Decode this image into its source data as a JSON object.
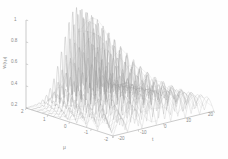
{
  "figure": {
    "kind": "matlab-3d-mesh-plot",
    "background": "#fefefe",
    "mesh_color": "#9a9a9a",
    "axis_color": "#a8a8a8",
    "tick_text_color": "#8a8a8a"
  },
  "axes": {
    "z": {
      "title": "W(t,μ)",
      "ticks": [
        "1",
        "0.8",
        "0.6",
        "0.4",
        "0.2"
      ],
      "values": [
        1,
        0.8,
        0.6,
        0.4,
        0.2
      ],
      "range": [
        0.2,
        1
      ]
    },
    "mu": {
      "title": "μ",
      "ticks": [
        "2",
        "1",
        "0",
        "-1",
        "-2"
      ],
      "values": [
        2,
        1,
        0,
        -1,
        -2
      ],
      "range": [
        -2,
        2
      ]
    },
    "t": {
      "title": "t",
      "ticks": [
        "-20",
        "-10",
        "0",
        "10",
        "20"
      ],
      "values": [
        -20,
        -10,
        0,
        10,
        20
      ],
      "range": [
        -20,
        20
      ]
    }
  },
  "chart_data": {
    "type": "line",
    "title": "",
    "xlabel": "t",
    "ylabel": "μ",
    "zlabel": "W(t,μ)",
    "xlim": [
      -20,
      20
    ],
    "ylim": [
      -2,
      2
    ],
    "zlim": [
      0.2,
      1
    ],
    "grid": false,
    "legend": null,
    "series": [
      {
        "name": "mu = -2.00",
        "mu": -2.0,
        "amplitude": 0.3,
        "frequency": 0.55,
        "envelope_width": 17.0
      },
      {
        "name": "mu = -1.75",
        "mu": -1.75,
        "amplitude": 0.32,
        "frequency": 0.6,
        "envelope_width": 16.0
      },
      {
        "name": "mu = -1.50",
        "mu": -1.5,
        "amplitude": 0.34,
        "frequency": 0.66,
        "envelope_width": 15.0
      },
      {
        "name": "mu = -1.25",
        "mu": -1.25,
        "amplitude": 0.37,
        "frequency": 0.72,
        "envelope_width": 14.0
      },
      {
        "name": "mu = -1.00",
        "mu": -1.0,
        "amplitude": 0.41,
        "frequency": 0.8,
        "envelope_width": 13.0
      },
      {
        "name": "mu = -0.75",
        "mu": -0.75,
        "amplitude": 0.45,
        "frequency": 0.88,
        "envelope_width": 12.0
      },
      {
        "name": "mu = -0.50",
        "mu": -0.5,
        "amplitude": 0.5,
        "frequency": 0.97,
        "envelope_width": 11.0
      },
      {
        "name": "mu = -0.25",
        "mu": -0.25,
        "amplitude": 0.56,
        "frequency": 1.06,
        "envelope_width": 10.0
      },
      {
        "name": "mu = 0.00",
        "mu": 0.0,
        "amplitude": 0.63,
        "frequency": 1.16,
        "envelope_width": 9.2
      },
      {
        "name": "mu = 0.25",
        "mu": 0.25,
        "amplitude": 0.7,
        "frequency": 1.27,
        "envelope_width": 8.4
      },
      {
        "name": "mu = 0.50",
        "mu": 0.5,
        "amplitude": 0.77,
        "frequency": 1.38,
        "envelope_width": 7.7
      },
      {
        "name": "mu = 0.75",
        "mu": 0.75,
        "amplitude": 0.84,
        "frequency": 1.5,
        "envelope_width": 7.1
      },
      {
        "name": "mu = 1.00",
        "mu": 1.0,
        "amplitude": 0.9,
        "frequency": 1.62,
        "envelope_width": 6.6
      },
      {
        "name": "mu = 1.25",
        "mu": 1.25,
        "amplitude": 0.95,
        "frequency": 1.74,
        "envelope_width": 6.2
      },
      {
        "name": "mu = 1.50",
        "mu": 1.5,
        "amplitude": 0.98,
        "frequency": 1.86,
        "envelope_width": 5.9
      },
      {
        "name": "mu = 1.75",
        "mu": 1.75,
        "amplitude": 1.0,
        "frequency": 1.98,
        "envelope_width": 5.6
      },
      {
        "name": "mu = 2.00",
        "mu": 2.0,
        "amplitude": 1.0,
        "frequency": 2.1,
        "envelope_width": 5.4
      }
    ]
  }
}
